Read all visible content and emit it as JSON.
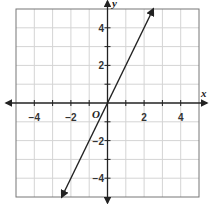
{
  "chart_data": {
    "type": "line",
    "title": "",
    "xlabel": "x",
    "ylabel": "y",
    "origin_label": "O",
    "xlim": [
      -5,
      5
    ],
    "ylim": [
      -5,
      5
    ],
    "grid": true,
    "x_ticks": [
      -4,
      -2,
      2,
      4
    ],
    "y_ticks": [
      4,
      2,
      -2,
      -4
    ],
    "x_tick_labels": [
      "−4",
      "−2",
      "2",
      "4"
    ],
    "y_tick_labels": [
      "4",
      "2",
      "−2",
      "−4"
    ],
    "series": [
      {
        "name": "line",
        "equation": "y = 2x",
        "x": [
          -2.5,
          0,
          2.5
        ],
        "y": [
          -5,
          0,
          5
        ],
        "arrows_both_ends": true
      }
    ]
  }
}
